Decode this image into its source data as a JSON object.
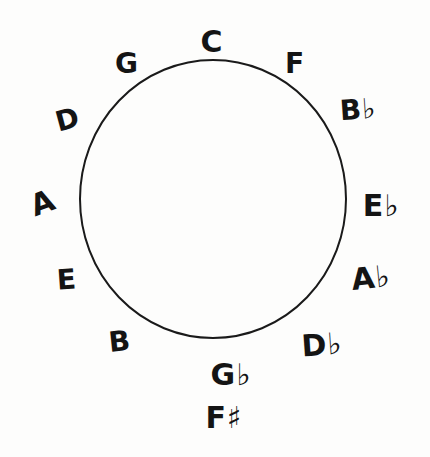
{
  "diagram": {
    "title": "Circle of Fifths",
    "circle": {
      "cx": 213,
      "cy": 199,
      "rx": 133,
      "ry": 139,
      "stroke": "#1a1a1a",
      "stroke_width": 2
    },
    "notes": [
      {
        "id": "C",
        "label": "C",
        "x": 212,
        "y": 42,
        "size": 30,
        "rotate": 0
      },
      {
        "id": "F",
        "label": "F",
        "x": 295,
        "y": 64,
        "size": 28,
        "rotate": 0
      },
      {
        "id": "Bb",
        "label": "B♭",
        "x": 358,
        "y": 110,
        "size": 28,
        "rotate": -4
      },
      {
        "id": "Eb",
        "label": "E♭",
        "x": 381,
        "y": 206,
        "size": 30,
        "rotate": 0
      },
      {
        "id": "Ab",
        "label": "A♭",
        "x": 371,
        "y": 278,
        "size": 30,
        "rotate": -6
      },
      {
        "id": "Db",
        "label": "D♭",
        "x": 322,
        "y": 345,
        "size": 30,
        "rotate": -4
      },
      {
        "id": "Gb",
        "label": "G♭",
        "x": 231,
        "y": 375,
        "size": 30,
        "rotate": 0
      },
      {
        "id": "F#",
        "label": "F♯",
        "x": 224,
        "y": 418,
        "size": 30,
        "rotate": 0
      },
      {
        "id": "B",
        "label": "B",
        "x": 120,
        "y": 342,
        "size": 28,
        "rotate": -6
      },
      {
        "id": "E",
        "label": "E",
        "x": 67,
        "y": 280,
        "size": 28,
        "rotate": -4
      },
      {
        "id": "A",
        "label": "A",
        "x": 43,
        "y": 203,
        "size": 30,
        "rotate": -20
      },
      {
        "id": "D",
        "label": "D",
        "x": 68,
        "y": 120,
        "size": 28,
        "rotate": -15
      },
      {
        "id": "G",
        "label": "G",
        "x": 127,
        "y": 64,
        "size": 28,
        "rotate": 0
      }
    ]
  }
}
